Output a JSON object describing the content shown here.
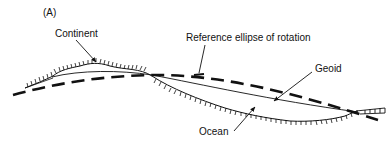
{
  "figure": {
    "panel_label": "(A)",
    "labels": {
      "continent": "Continent",
      "reference_ellipse": "Reference ellipse of rotation",
      "geoid": "Geoid",
      "ocean": "Ocean"
    },
    "colors": {
      "ink": "#111111",
      "background": "#ffffff"
    }
  }
}
